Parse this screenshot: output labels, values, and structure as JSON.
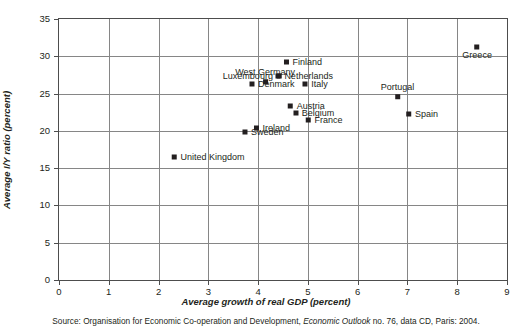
{
  "chart_data": {
    "type": "scatter",
    "title": "",
    "xlabel": "Average growth of real GDP (percent)",
    "ylabel": "Average I/Y ratio (percent)",
    "xlim": [
      0,
      9
    ],
    "ylim": [
      0,
      35
    ],
    "xticks": [
      "0",
      "1",
      "2",
      "3",
      "4",
      "5",
      "6",
      "7",
      "8",
      "9"
    ],
    "yticks": [
      "0",
      "5",
      "10",
      "15",
      "20",
      "25",
      "30",
      "35"
    ],
    "grid": true,
    "legend": "none",
    "marker_color": "#231f20",
    "points": [
      {
        "label": "Luxembourg",
        "x": 3.88,
        "y": 27.3,
        "label_pos": "left"
      },
      {
        "label": "West Germany",
        "x": 4.14,
        "y": 27.3,
        "label_pos": "above"
      },
      {
        "label": "Denmark",
        "x": 4.28,
        "y": 26.3,
        "label_pos": "right"
      },
      {
        "label": "Finland",
        "x": 4.9,
        "y": 29.2,
        "label_pos": "right"
      },
      {
        "label": "Netherlands",
        "x": 4.93,
        "y": 27.3,
        "label_pos": "right"
      },
      {
        "label": "Italy",
        "x": 5.15,
        "y": 26.3,
        "label_pos": "right"
      },
      {
        "label": "Austria",
        "x": 4.97,
        "y": 23.3,
        "label_pos": "right"
      },
      {
        "label": "Belgium",
        "x": 5.12,
        "y": 22.4,
        "label_pos": "right"
      },
      {
        "label": "France",
        "x": 5.33,
        "y": 21.4,
        "label_pos": "right"
      },
      {
        "label": "Ireland",
        "x": 4.28,
        "y": 20.4,
        "label_pos": "right"
      },
      {
        "label": "Sweden",
        "x": 4.1,
        "y": 19.9,
        "label_pos": "right"
      },
      {
        "label": "United Kingdom",
        "x": 3.0,
        "y": 16.5,
        "label_pos": "right"
      },
      {
        "label": "Portugal",
        "x": 6.8,
        "y": 25.3,
        "label_pos": "above"
      },
      {
        "label": "Spain",
        "x": 7.3,
        "y": 22.3,
        "label_pos": "right"
      },
      {
        "label": "Greece",
        "x": 8.4,
        "y": 30.5,
        "label_pos": "below"
      }
    ]
  },
  "source": {
    "prefix": "Source: Organisation for Economic Co-operation and Development, ",
    "italic": "Economic Outlook",
    "suffix": " no. 76, data CD, Paris: 2004."
  }
}
